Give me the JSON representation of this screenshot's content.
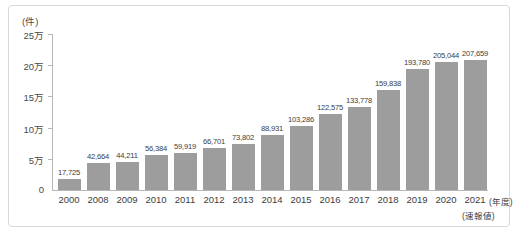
{
  "chart_data": {
    "type": "bar",
    "title": "",
    "unit_label": "(件)",
    "xlabel": "(年度)",
    "ylabel": "",
    "xlabel_note": "(速報値)",
    "categories": [
      "2000",
      "2008",
      "2009",
      "2010",
      "2011",
      "2012",
      "2013",
      "2014",
      "2015",
      "2016",
      "2017",
      "2018",
      "2019",
      "2020",
      "2021"
    ],
    "values": [
      17725,
      42664,
      44211,
      56384,
      59919,
      66701,
      73802,
      88931,
      103286,
      122575,
      133778,
      159838,
      193780,
      205044,
      207659
    ],
    "value_labels": [
      "17,725",
      "42,664",
      "44,211",
      "56,384",
      "59,919",
      "66,701",
      "73,802",
      "88,931",
      "103,286",
      "122,575",
      "133,778",
      "159,838",
      "193,780",
      "205,044",
      "207,659"
    ],
    "ylim": [
      0,
      250000
    ],
    "ytick_values": [
      0,
      50000,
      100000,
      150000,
      200000,
      250000
    ],
    "ytick_labels": [
      "0",
      "5万",
      "10万",
      "15万",
      "20万",
      "25万"
    ],
    "grid": false,
    "legend": "none",
    "bar_color": "#9d9d9d",
    "axis_color": "#b5b5b5",
    "text_color": "#3d3d3d"
  },
  "caption": "",
  "frame": {
    "border_color": "#d8d8d8"
  }
}
